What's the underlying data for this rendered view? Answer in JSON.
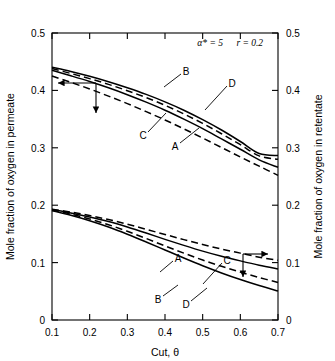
{
  "chart_data": {
    "type": "line",
    "title": "",
    "xlabel": "Cut, θ",
    "ylabel": "Mole fraction of oxygen in permeate",
    "ylabel_right": "Mole fraction of oxygen in retentate",
    "xlim": [
      0.1,
      0.7
    ],
    "ylim": [
      0.0,
      0.5
    ],
    "ylim_right": [
      0.0,
      0.5
    ],
    "grid": false,
    "legend": "inline-curve-labels",
    "annotations": [
      {
        "text": "α* = 5",
        "x": 0.52,
        "y": 0.478
      },
      {
        "text": "r = 0.2",
        "x": 0.625,
        "y": 0.478
      }
    ],
    "xticks": [
      0.1,
      0.2,
      0.3,
      0.4,
      0.5,
      0.6,
      0.7
    ],
    "xticklabels": [
      "0.1",
      "0.2",
      "0.3",
      "0.4",
      "0.5",
      "0.6",
      "0.7"
    ],
    "yticks": [
      0,
      0.1,
      0.2,
      0.3,
      0.4,
      0.5
    ],
    "yticklabels": [
      "0",
      "0.1",
      "0.2",
      "0.3",
      "0.4",
      "0.5"
    ],
    "yticks_right": [
      0,
      0.1,
      0.2,
      0.3,
      0.4,
      0.5
    ],
    "yticklabels_right": [
      "0",
      "0.1",
      "0.2",
      "0.3",
      "0.4",
      "0.5"
    ],
    "x": [
      0.1,
      0.15,
      0.2,
      0.25,
      0.3,
      0.35,
      0.4,
      0.45,
      0.5,
      0.55,
      0.6,
      0.65,
      0.7
    ],
    "groups": [
      {
        "name": "permeate",
        "axis": "left",
        "indicator": "arrow-left-down",
        "series": [
          {
            "name": "B",
            "style": "solid",
            "values": [
              0.4405,
              0.433,
              0.4245,
              0.415,
              0.4045,
              0.393,
              0.38,
              0.3655,
              0.349,
              0.331,
              0.311,
              0.29,
              0.2865
            ]
          },
          {
            "name": "D",
            "style": "dashed",
            "values": [
              0.438,
              0.4295,
              0.4205,
              0.4105,
              0.3995,
              0.3875,
              0.374,
              0.359,
              0.3425,
              0.3245,
              0.3055,
              0.286,
              0.28
            ]
          },
          {
            "name": "C",
            "style": "solid",
            "values": [
              0.435,
              0.4255,
              0.4155,
              0.4045,
              0.3925,
              0.3795,
              0.3655,
              0.35,
              0.3335,
              0.3155,
              0.2975,
              0.279,
              0.266
            ]
          },
          {
            "name": "A",
            "style": "dashed",
            "values": [
              0.425,
              0.414,
              0.4025,
              0.39,
              0.377,
              0.363,
              0.3485,
              0.333,
              0.317,
              0.3005,
              0.284,
              0.268,
              0.252
            ]
          }
        ]
      },
      {
        "name": "retentate",
        "axis": "right",
        "indicator": "arrow-right-down",
        "series": [
          {
            "name": "A",
            "style": "dashed",
            "values": [
              0.193,
              0.188,
              0.182,
              0.175,
              0.167,
              0.158,
              0.149,
              0.14,
              0.1315,
              0.1235,
              0.1165,
              0.1095,
              0.104
            ]
          },
          {
            "name": "C",
            "style": "solid",
            "values": [
              0.1925,
              0.1865,
              0.1795,
              0.1715,
              0.162,
              0.1515,
              0.1405,
              0.13,
              0.12,
              0.111,
              0.103,
              0.0955,
              0.089
            ]
          },
          {
            "name": "D",
            "style": "dashed",
            "values": [
              0.1915,
              0.1845,
              0.176,
              0.166,
              0.1545,
              0.142,
              0.129,
              0.1165,
              0.1045,
              0.0935,
              0.0835,
              0.074,
              0.0655
            ]
          },
          {
            "name": "B",
            "style": "solid",
            "values": [
              0.1905,
              0.1825,
              0.173,
              0.162,
              0.1495,
              0.136,
              0.122,
              0.108,
              0.0945,
              0.082,
              0.0705,
              0.06,
              0.0505
            ]
          }
        ]
      }
    ],
    "curve_labels": [
      {
        "text": "B",
        "group": "permeate",
        "lx": 186,
        "ly": 71,
        "ax": 164,
        "ay": 87
      },
      {
        "text": "D",
        "group": "permeate",
        "lx": 232,
        "ly": 83,
        "ax": 205,
        "ay": 110
      },
      {
        "text": "C",
        "group": "permeate",
        "lx": 143,
        "ly": 135,
        "ax": 166,
        "ay": 113
      },
      {
        "text": "A",
        "group": "permeate",
        "lx": 175,
        "ly": 146,
        "ax": 199,
        "ay": 128
      },
      {
        "text": "A",
        "group": "retentate",
        "lx": 178,
        "ly": 258,
        "ax": 160,
        "ay": 272
      },
      {
        "text": "C",
        "group": "retentate",
        "lx": 227,
        "ly": 260,
        "ax": 203,
        "ay": 284
      },
      {
        "text": "B",
        "group": "retentate",
        "lx": 158,
        "ly": 299,
        "ax": 178,
        "ay": 285
      },
      {
        "text": "D",
        "group": "retentate",
        "lx": 186,
        "ly": 304,
        "ax": 207,
        "ay": 288
      }
    ]
  },
  "axes": {
    "left_title": "Mole fraction of oxygen in permeate",
    "right_title": "Mole fraction of oxygen in retentate",
    "bottom_title": "Cut, θ"
  }
}
